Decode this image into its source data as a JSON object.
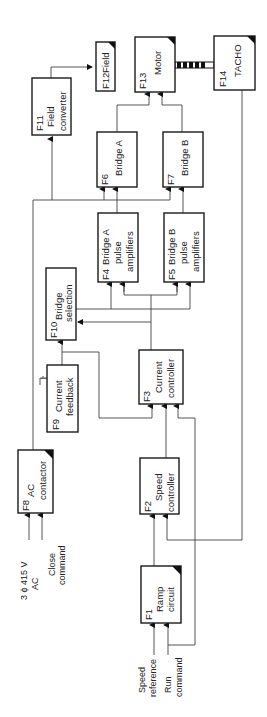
{
  "diagram": {
    "type": "block-diagram",
    "orientation": "rotated-90-ccw",
    "blocks": {
      "f1": {
        "id": "F1",
        "line1": "Ramp",
        "line2": "circuit"
      },
      "f2": {
        "id": "F2",
        "line1": "Speed",
        "line2": "controller"
      },
      "f3": {
        "id": "F3",
        "line1": "Current",
        "line2": "controller"
      },
      "f4": {
        "id": "F4",
        "line1": "Bridge  A",
        "line2": "pulse",
        "line3": "amplifiers"
      },
      "f5": {
        "id": "F5",
        "line1": "Bridge B",
        "line2": "pulse",
        "line3": "amplifiers"
      },
      "f6": {
        "id": "F6",
        "line1": "Bridge  A"
      },
      "f7": {
        "id": "F7",
        "line1": "Bridge  B"
      },
      "f8": {
        "id": "F8",
        "line1": "AC",
        "line2": "contactor"
      },
      "f9": {
        "id": "F9",
        "line1": "Current",
        "line2": "feedback"
      },
      "f10": {
        "id": "F10",
        "line1": "Bridge",
        "line2": "selection"
      },
      "f11": {
        "id": "F11",
        "line1": "Field",
        "line2": "converter"
      },
      "f12": {
        "id": "F12",
        "line1": "Field"
      },
      "f13": {
        "id": "F13",
        "line1": "Motor"
      },
      "f14": {
        "id": "F14",
        "line1": "TACHO"
      }
    },
    "inputs": {
      "supply_line1": "3 ϕ 415 V",
      "supply_line2": "AC",
      "close_line1": "Close",
      "close_line2": "command",
      "speed_ref_line1": "Speed",
      "speed_ref_line2": "reference",
      "run_line1": "Run",
      "run_line2": "command"
    },
    "colors": {
      "line": "#444444",
      "box_border": "#1a1a1a",
      "background": "#ffffff"
    }
  }
}
